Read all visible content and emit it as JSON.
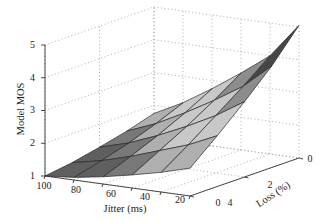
{
  "chart_data": {
    "type": "surface3d",
    "title": "",
    "xlabel": "Jitter (ms)",
    "ylabel": "Loss (%)",
    "zlabel": "Model MOS",
    "x_ticks": [
      100,
      80,
      60,
      40,
      20,
      0
    ],
    "y_ticks": [
      4,
      2,
      0
    ],
    "z_ticks": [
      1,
      2,
      3,
      4,
      5
    ],
    "xlim": [
      0,
      100
    ],
    "ylim": [
      0,
      4
    ],
    "zlim": [
      1,
      5
    ],
    "grid": true,
    "colormap": "gray",
    "x": [
      0,
      20,
      40,
      60,
      80,
      100
    ],
    "y": [
      0,
      1,
      2,
      3,
      4
    ],
    "z_comment": "rows indexed by loss (0..4), columns by jitter (0..100)",
    "z": [
      [
        5.05,
        4.0,
        3.35,
        2.75,
        2.2,
        1.75
      ],
      [
        4.1,
        3.35,
        2.8,
        2.3,
        1.85,
        1.5
      ],
      [
        3.3,
        2.75,
        2.3,
        1.9,
        1.55,
        1.3
      ],
      [
        2.55,
        2.15,
        1.85,
        1.55,
        1.3,
        1.12
      ],
      [
        1.85,
        1.6,
        1.4,
        1.22,
        1.08,
        1.0
      ]
    ]
  },
  "labels": {
    "zlabel": "Model MOS",
    "xlabel": "Jitter (ms)",
    "ylabel": "Loss (%)"
  },
  "ticks": {
    "z": [
      "1",
      "2",
      "3",
      "4",
      "5"
    ],
    "x": [
      "100",
      "80",
      "60",
      "40",
      "20",
      "0"
    ],
    "y": [
      "4",
      "2",
      "0"
    ]
  }
}
